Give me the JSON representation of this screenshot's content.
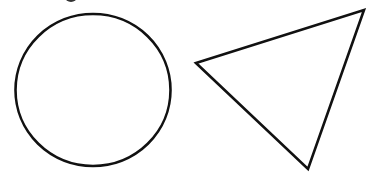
{
  "canvas": {
    "width": 368,
    "height": 181,
    "background": "#ffffff"
  },
  "stroke": {
    "color": "#111111",
    "width": 2.6
  },
  "shapes": {
    "top_mark": {
      "type": "partial-mark",
      "cx": 71,
      "cy": -3,
      "rx": 6,
      "ry": 5,
      "fill": "#333333"
    },
    "circle": {
      "type": "circle",
      "cx": 93,
      "cy": 90,
      "rx": 77.5,
      "ry": 76
    },
    "triangle": {
      "type": "triangle",
      "points": [
        [
          196,
          63
        ],
        [
          364,
          10
        ],
        [
          308,
          169
        ]
      ]
    }
  }
}
